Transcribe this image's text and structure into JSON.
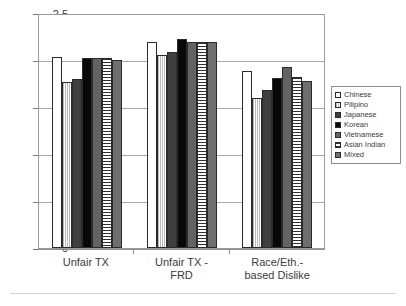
{
  "chart_data": {
    "type": "bar",
    "title": "",
    "xlabel": "",
    "ylabel": "",
    "ylim": [
      0,
      2.5
    ],
    "ytick_labels": [
      "2.5",
      "2",
      "1.5",
      "1",
      "0.5",
      "0"
    ],
    "ytick_values": [
      2.5,
      2,
      1.5,
      1,
      0.5,
      0
    ],
    "grid": true,
    "legend_position": "right",
    "categories": [
      "Unfair TX",
      "Unfair TX - FRD",
      "Race/Eth.-based Dislike"
    ],
    "category_labels": [
      [
        "Unfair TX"
      ],
      [
        "Unfair TX -",
        "FRD"
      ],
      [
        "Race/Eth.-",
        "based Dislike"
      ]
    ],
    "series": [
      {
        "name": "Chinese",
        "fill": "f-chinese",
        "swatch_color": "#ffffff",
        "values": [
          2.03,
          2.19,
          1.88
        ]
      },
      {
        "name": "Pilipino",
        "fill": "f-pilipino",
        "swatch_color": "#d0d0d0",
        "values": [
          1.77,
          2.05,
          1.6
        ]
      },
      {
        "name": "Japanese",
        "fill": "f-japanese",
        "swatch_color": "#3f3f3f",
        "values": [
          1.8,
          2.08,
          1.68
        ]
      },
      {
        "name": "Korean",
        "fill": "f-korean",
        "swatch_color": "#080808",
        "values": [
          2.02,
          2.22,
          1.81
        ]
      },
      {
        "name": "Vietnamese",
        "fill": "f-vietnamese",
        "swatch_color": "#636363",
        "values": [
          2.02,
          2.19,
          1.93
        ]
      },
      {
        "name": "Asian Indian",
        "fill": "f-asianindian",
        "swatch_color": "#e2e2e2",
        "values": [
          2.02,
          2.19,
          1.82
        ]
      },
      {
        "name": "Mixed",
        "fill": "f-mixed",
        "swatch_color": "#6f6f6f",
        "values": [
          2.0,
          2.19,
          1.78
        ]
      }
    ]
  }
}
